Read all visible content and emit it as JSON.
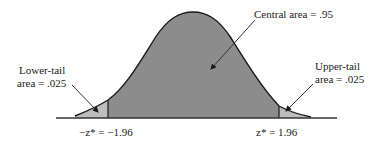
{
  "diagram": {
    "type": "normal-distribution-critical-values",
    "labels": {
      "central": "Central area = .95",
      "lower_tail_line1": "Lower-tail",
      "lower_tail_line2": "area = .025",
      "upper_tail_line1": "Upper-tail",
      "upper_tail_line2": "area = .025",
      "lower_z": "−z* = −1.96",
      "upper_z": "z* = 1.96"
    },
    "values": {
      "central_area": 0.95,
      "lower_tail_area": 0.025,
      "upper_tail_area": 0.025,
      "lower_critical_z": -1.96,
      "upper_critical_z": 1.96
    },
    "colors": {
      "central_fill": "#8c8c8c",
      "tail_fill": "#bdbdbd",
      "curve_stroke": "#1a1a1a",
      "axis": "#333333"
    }
  }
}
